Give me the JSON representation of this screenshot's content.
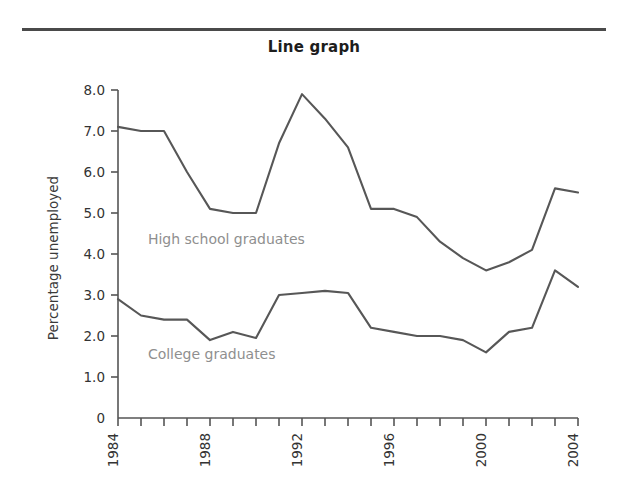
{
  "title": "Line graph",
  "colors": {
    "rule": "#4a4a4a",
    "axis": "#555555",
    "line": "#575757",
    "annotation": "#8f8f8f",
    "background": "#ffffff"
  },
  "chart_data": {
    "type": "line",
    "title": "Line graph",
    "xlabel": "",
    "ylabel": "Percentage unemployed",
    "xlim": [
      1984,
      2004
    ],
    "ylim": [
      0,
      8
    ],
    "grid": false,
    "legend": "inline-annotations",
    "y_ticks": [
      0,
      1.0,
      2.0,
      3.0,
      4.0,
      5.0,
      6.0,
      7.0,
      8.0
    ],
    "y_tick_labels": [
      "0",
      "1.0",
      "2.0",
      "3.0",
      "4.0",
      "5.0",
      "6.0",
      "7.0",
      "8.0"
    ],
    "x_ticks": [
      1984,
      1985,
      1986,
      1987,
      1988,
      1989,
      1990,
      1991,
      1992,
      1993,
      1994,
      1995,
      1996,
      1997,
      1998,
      1999,
      2000,
      2001,
      2002,
      2003,
      2004
    ],
    "x_tick_labels": [
      "1984",
      "",
      "",
      "",
      "1988",
      "",
      "",
      "",
      "1992",
      "",
      "",
      "",
      "1996",
      "",
      "",
      "",
      "2000",
      "",
      "",
      "",
      "2004"
    ],
    "x_labels_rotated": true,
    "x": [
      1984,
      1985,
      1986,
      1987,
      1988,
      1989,
      1990,
      1991,
      1992,
      1993,
      1994,
      1995,
      1996,
      1997,
      1998,
      1999,
      2000,
      2001,
      2002,
      2003,
      2004
    ],
    "series": [
      {
        "name": "High school graduates",
        "values": [
          7.1,
          7.0,
          7.0,
          6.0,
          5.1,
          5.0,
          5.0,
          6.7,
          7.9,
          7.3,
          6.6,
          5.1,
          5.1,
          4.9,
          4.3,
          3.9,
          3.6,
          3.8,
          4.1,
          5.6,
          5.5
        ],
        "annotation": "High school graduates",
        "annotation_x": 1985.3,
        "annotation_y": 4.25
      },
      {
        "name": "College graduates",
        "values": [
          2.9,
          2.5,
          2.4,
          2.4,
          1.9,
          2.1,
          1.95,
          3.0,
          3.05,
          3.1,
          3.05,
          2.2,
          2.1,
          2.0,
          2.0,
          1.9,
          1.6,
          2.1,
          2.2,
          3.6,
          3.2
        ],
        "annotation": "College graduates",
        "annotation_x": 1985.3,
        "annotation_y": 1.43
      }
    ]
  }
}
